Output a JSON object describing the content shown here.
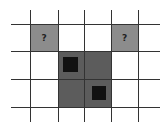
{
  "colors": {
    "background": "#ffffff",
    "grid_line": "#333333",
    "unknown_cell": "#8c8c8c",
    "revealed_region": "#5c5c5c",
    "mine": "#111111"
  },
  "grid": {
    "vlines": [
      30,
      58,
      84,
      111,
      138
    ],
    "hlines": [
      24,
      51,
      79,
      107
    ],
    "vline_span": [
      10,
      122
    ],
    "hline_span": [
      11,
      160
    ]
  },
  "unknown_cells": [
    {
      "x": 30,
      "y": 24,
      "w": 28,
      "h": 27,
      "label": "?"
    },
    {
      "x": 111,
      "y": 24,
      "w": 27,
      "h": 27,
      "label": "?"
    }
  ],
  "region": {
    "x": 58,
    "y": 51,
    "w": 53,
    "h": 56
  },
  "mines": [
    {
      "x": 63,
      "y": 57,
      "w": 15,
      "h": 15
    },
    {
      "x": 92,
      "y": 86,
      "w": 14,
      "h": 14
    }
  ]
}
